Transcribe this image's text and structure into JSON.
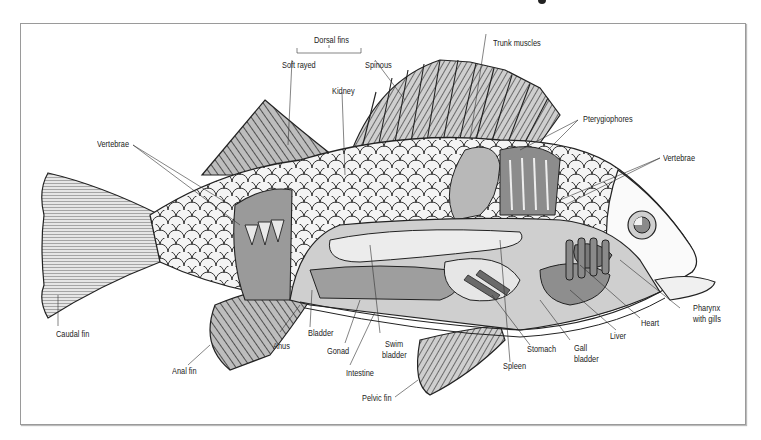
{
  "figure": {
    "labels": {
      "dorsal_fins": "Dorsal fins",
      "soft_rayed": "Soft rayed",
      "spinous": "Spinous",
      "trunk_muscles": "Trunk muscles",
      "kidney": "Kidney",
      "pterygiophores": "Pterygiophores",
      "vertebrae_left": "Vertebrae",
      "vertebrae_right": "Vertebrae",
      "caudal_fin": "Caudal fin",
      "anal_fin": "Anal fin",
      "anus": "Anus",
      "bladder": "Bladder",
      "gonad": "Gonad",
      "swim_bladder_1": "Swim",
      "swim_bladder_2": "bladder",
      "intestine": "Intestine",
      "pelvic_fin": "Pelvic fin",
      "spleen": "Spleen",
      "stomach": "Stomach",
      "gall_bladder_1": "Gall",
      "gall_bladder_2": "bladder",
      "liver": "Liver",
      "heart": "Heart",
      "pharynx_1": "Pharynx",
      "pharynx_2": "with gills"
    },
    "colors": {
      "line": "#1a1a1a",
      "fin_dark": "#6e6e6e",
      "fin_light": "#c8c8c8",
      "organ_light": "#e2e2e2",
      "organ_mid": "#a8a8a8",
      "organ_dark": "#7a7a7a",
      "frame": "#9a9a9a"
    }
  }
}
